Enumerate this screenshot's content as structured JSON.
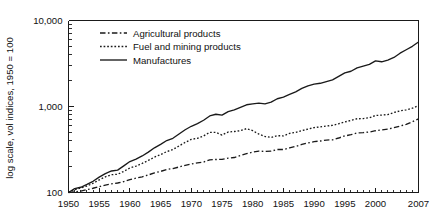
{
  "chart_data": {
    "type": "line",
    "title": "",
    "subtitle": "",
    "xlabel": "",
    "ylabel": "log scale, vol indices, 1950 = 100",
    "yscale": "log",
    "ylim": [
      100,
      10000
    ],
    "xlim": [
      1950,
      2007
    ],
    "grid": false,
    "legend_position": "top-left-inside",
    "y_tick_labels": [
      "10,000",
      "1,000",
      "100"
    ],
    "y_tick_values": [
      10000,
      1000,
      100
    ],
    "x_tick_labels": [
      "1950",
      "1955",
      "1960",
      "1965",
      "1970",
      "1975",
      "1980",
      "1985",
      "1990",
      "1995",
      "2000",
      "2007"
    ],
    "x_tick_values": [
      1950,
      1955,
      1960,
      1965,
      1970,
      1975,
      1980,
      1985,
      1990,
      1995,
      2000,
      2007
    ],
    "x": [
      1950,
      1951,
      1952,
      1953,
      1954,
      1955,
      1956,
      1957,
      1958,
      1959,
      1960,
      1961,
      1962,
      1963,
      1964,
      1965,
      1966,
      1967,
      1968,
      1969,
      1970,
      1971,
      1972,
      1973,
      1974,
      1975,
      1976,
      1977,
      1978,
      1979,
      1980,
      1981,
      1982,
      1983,
      1984,
      1985,
      1986,
      1987,
      1988,
      1989,
      1990,
      1991,
      1992,
      1993,
      1994,
      1995,
      1996,
      1997,
      1998,
      1999,
      2000,
      2001,
      2002,
      2003,
      2004,
      2005,
      2006,
      2007
    ],
    "series": [
      {
        "name": "Agricultural products",
        "linestyle": "dash-dot",
        "color": "#1a1a1a",
        "values": [
          100,
          102,
          104,
          108,
          112,
          117,
          122,
          126,
          129,
          134,
          141,
          147,
          152,
          160,
          169,
          176,
          185,
          190,
          198,
          207,
          215,
          221,
          226,
          240,
          242,
          243,
          251,
          255,
          269,
          283,
          295,
          303,
          300,
          303,
          316,
          316,
          330,
          344,
          362,
          377,
          390,
          397,
          407,
          410,
          430,
          455,
          470,
          492,
          497,
          505,
          523,
          534,
          546,
          567,
          592,
          620,
          665,
          718
        ]
      },
      {
        "name": "Fuel and mining products",
        "linestyle": "dotted",
        "color": "#1a1a1a",
        "values": [
          100,
          108,
          113,
          119,
          128,
          140,
          152,
          161,
          163,
          176,
          193,
          203,
          218,
          236,
          258,
          276,
          299,
          316,
          348,
          382,
          415,
          427,
          455,
          500,
          500,
          466,
          505,
          512,
          524,
          553,
          524,
          478,
          448,
          437,
          458,
          455,
          487,
          500,
          524,
          546,
          569,
          580,
          592,
          604,
          630,
          660,
          690,
          720,
          724,
          740,
          787,
          794,
          806,
          851,
          891,
          912,
          955,
          1023
        ]
      },
      {
        "name": "Manufactures",
        "linestyle": "solid",
        "color": "#1a1a1a",
        "values": [
          100,
          111,
          115,
          124,
          135,
          151,
          166,
          178,
          182,
          204,
          229,
          245,
          266,
          295,
          331,
          363,
          402,
          427,
          479,
          537,
          589,
          631,
          692,
          776,
          813,
          794,
          871,
          912,
          977,
          1047,
          1072,
          1096,
          1072,
          1122,
          1230,
          1288,
          1380,
          1479,
          1622,
          1738,
          1820,
          1862,
          1950,
          2042,
          2239,
          2455,
          2570,
          2818,
          2951,
          3090,
          3388,
          3311,
          3467,
          3715,
          4169,
          4571,
          5012,
          5623
        ]
      }
    ]
  },
  "axis": {
    "y_title": "log scale, vol indices, 1950 = 100"
  },
  "legend": {
    "items": [
      {
        "label": "Agricultural products",
        "style": "dash-dot"
      },
      {
        "label": "Fuel and mining products",
        "style": "dotted"
      },
      {
        "label": "Manufactures",
        "style": "solid"
      }
    ]
  }
}
